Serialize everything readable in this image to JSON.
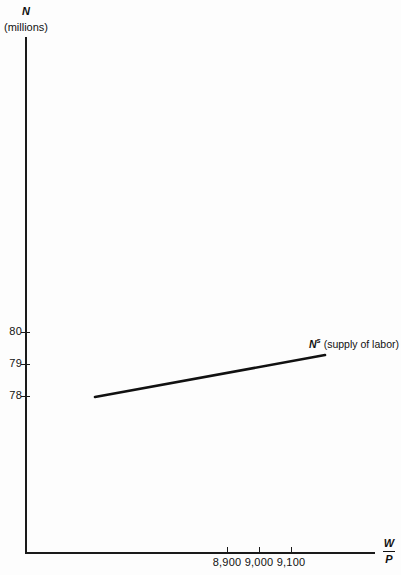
{
  "chart_data": {
    "type": "line",
    "title": "",
    "subtitle": "",
    "xlabel": "W/P",
    "xlabel_numerator": "W",
    "xlabel_denominator": "P",
    "ylabel": "N",
    "ylabel_unit": "(millions)",
    "grid": false,
    "legend_position": "inline-right",
    "xlim": [
      8840,
      9190
    ],
    "ylim": [
      76.6,
      84.1
    ],
    "xticks": [
      8900,
      9000,
      9100
    ],
    "xticklabels": [
      "8,900",
      "9,000",
      "9,100"
    ],
    "yticks": [
      78,
      79,
      80
    ],
    "yticklabels": [
      "78",
      "79",
      "80"
    ],
    "series": [
      {
        "name": "N^s (supply of labor)",
        "label": "N",
        "label_superscript": "s",
        "label_suffix": " (supply of labor)",
        "color": "#111111",
        "linewidth": 2.6,
        "x": [
          8880,
          9160
        ],
        "y": [
          78.0,
          79.3
        ]
      }
    ],
    "annotations": [
      {
        "name": "curve-label",
        "text": "N^s (supply of labor)",
        "x": 9160,
        "y": 79.5
      }
    ]
  },
  "axes": {
    "y_label_symbol": "N",
    "y_label_unit": "(millions)",
    "x_label_numerator": "W",
    "x_label_denominator": "P",
    "y_ticks": [
      {
        "value": 80,
        "label": "80",
        "py": 332
      },
      {
        "value": 79,
        "label": "79",
        "py": 364
      },
      {
        "value": 78,
        "label": "78",
        "py": 396
      }
    ],
    "x_ticks": [
      {
        "value": 8900,
        "label": "8,900",
        "px": 227
      },
      {
        "value": 9000,
        "label": "9,000",
        "px": 259
      },
      {
        "value": 9100,
        "label": "9,100",
        "px": 291
      }
    ]
  },
  "curve": {
    "label_symbol": "N",
    "label_superscript": "s",
    "label_text": " (supply of labor)",
    "color": "#111111",
    "x1": 95,
    "y1": 397,
    "x2": 325,
    "y2": 355
  },
  "colors": {
    "ink": "#111111",
    "axis": "#1a1a1a",
    "background": "#fdfdfd"
  }
}
